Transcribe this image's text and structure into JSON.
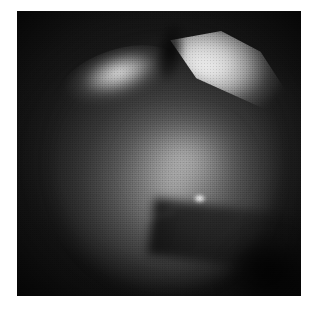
{
  "page": {
    "background_color": "#ffffff",
    "width": 316,
    "height": 310
  },
  "figure": {
    "kind": "photograph",
    "modality": "endoscopic-grayscale-photograph",
    "caption": "",
    "plate": {
      "x": 17,
      "y": 11,
      "width": 284,
      "height": 285,
      "border_color": "#0d0d0d",
      "background_color": "#121212"
    },
    "palette": {
      "background": "#ffffff",
      "field_dark": "#121212",
      "corner_black": "#060606",
      "mass_midtone": "#6e6e6e",
      "mass_light": "#c4c4c4",
      "highlight_bright": "#fcfcfc",
      "specular_white": "#ffffff"
    },
    "regions": [
      {
        "name": "upper-left-crescent-highlight",
        "description": "bright curved crescent along the upper-left shoulder of the mass",
        "brightness": "bright",
        "center_pct": [
          34,
          19
        ]
      },
      {
        "name": "upper-right-wedge-highlight",
        "description": "brightest wedge-shaped specular band sweeping down to the right",
        "brightness": "brightest",
        "center_pct": [
          74,
          20
        ]
      },
      {
        "name": "dark-notch",
        "description": "dark V-shaped gap separating the two upper highlights",
        "brightness": "dark",
        "center_pct": [
          54,
          14
        ]
      },
      {
        "name": "central-tissue-mass",
        "description": "large rounded mid-gray tissue body filling the frame",
        "brightness": "midtone",
        "center_pct": [
          52,
          56
        ]
      },
      {
        "name": "central-specular-point",
        "description": "small intense white point reflection near the centre",
        "brightness": "brightest",
        "center_pct": [
          64,
          66
        ]
      },
      {
        "name": "lower-fold-shadow",
        "description": "dark diagonal fold sweeping from the centre to the lower right",
        "brightness": "dark",
        "center_pct": [
          76,
          78
        ]
      },
      {
        "name": "corner-vignette",
        "description": "near-black circular vignette masking the plate corners",
        "brightness": "black",
        "center_pct": [
          50,
          50
        ]
      }
    ]
  }
}
